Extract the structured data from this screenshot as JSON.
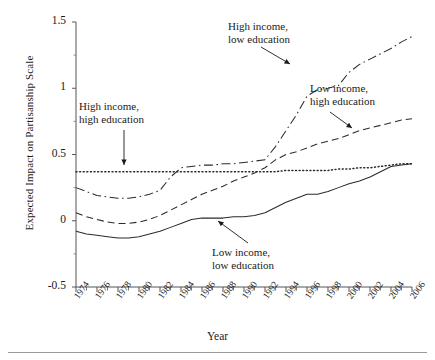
{
  "figure": {
    "xlabel": "Year",
    "ylabel": "Expected Impact on Partisanship Scale",
    "yticks": [
      "1.5",
      "1",
      "0.5",
      "0",
      "-0.5"
    ],
    "xticks": [
      "1974",
      "1976",
      "1978",
      "1980",
      "1982",
      "1984",
      "1986",
      "1988",
      "1990",
      "1992",
      "1994",
      "1996",
      "1998",
      "2000",
      "2002",
      "2004",
      "2006"
    ]
  },
  "annotations": {
    "hi_hi": {
      "line1": "High income,",
      "line2": "high education"
    },
    "hi_lo": {
      "line1": "High income,",
      "line2": "low education"
    },
    "lo_hi": {
      "line1": "Low income,",
      "line2": "high education"
    },
    "lo_lo": {
      "line1": "Low income,",
      "line2": "low education"
    }
  },
  "chart_data": {
    "type": "line",
    "title": "",
    "xlabel": "Year",
    "ylabel": "Expected Impact on Partisanship Scale",
    "xlim": [
      1974,
      2006
    ],
    "ylim": [
      -0.5,
      1.5
    ],
    "ytick_values": [
      1.5,
      1,
      0.5,
      0,
      -0.5
    ],
    "grid": false,
    "legend": "annotations-with-arrows",
    "x": [
      1974,
      1975,
      1976,
      1977,
      1978,
      1979,
      1980,
      1981,
      1982,
      1983,
      1984,
      1985,
      1986,
      1987,
      1988,
      1989,
      1990,
      1991,
      1992,
      1993,
      1994,
      1995,
      1996,
      1997,
      1998,
      1999,
      2000,
      2001,
      2002,
      2003,
      2004,
      2005,
      2006
    ],
    "series": [
      {
        "name": "High income, high education",
        "style": "dotted",
        "values": [
          0.37,
          0.37,
          0.37,
          0.37,
          0.37,
          0.37,
          0.37,
          0.37,
          0.37,
          0.37,
          0.37,
          0.37,
          0.37,
          0.37,
          0.37,
          0.37,
          0.37,
          0.37,
          0.37,
          0.37,
          0.38,
          0.38,
          0.38,
          0.38,
          0.38,
          0.39,
          0.39,
          0.4,
          0.4,
          0.41,
          0.42,
          0.43,
          0.43
        ]
      },
      {
        "name": "High income, low education",
        "style": "dash-dot",
        "values": [
          0.25,
          0.22,
          0.19,
          0.18,
          0.17,
          0.17,
          0.18,
          0.2,
          0.23,
          0.33,
          0.4,
          0.41,
          0.42,
          0.42,
          0.43,
          0.43,
          0.44,
          0.45,
          0.46,
          0.56,
          0.68,
          0.8,
          0.94,
          0.99,
          1.0,
          1.02,
          1.12,
          1.18,
          1.22,
          1.26,
          1.3,
          1.35,
          1.39
        ]
      },
      {
        "name": "Low income, high education",
        "style": "dashed",
        "values": [
          0.06,
          0.03,
          0.01,
          -0.01,
          -0.02,
          -0.02,
          -0.01,
          0.01,
          0.04,
          0.08,
          0.12,
          0.16,
          0.2,
          0.23,
          0.26,
          0.3,
          0.33,
          0.36,
          0.4,
          0.46,
          0.5,
          0.52,
          0.55,
          0.58,
          0.6,
          0.62,
          0.65,
          0.68,
          0.7,
          0.72,
          0.74,
          0.76,
          0.77
        ]
      },
      {
        "name": "Low income, low education",
        "style": "solid",
        "values": [
          -0.08,
          -0.1,
          -0.11,
          -0.12,
          -0.13,
          -0.13,
          -0.12,
          -0.1,
          -0.08,
          -0.05,
          -0.02,
          0.01,
          0.02,
          0.02,
          0.02,
          0.03,
          0.03,
          0.04,
          0.06,
          0.1,
          0.14,
          0.17,
          0.2,
          0.2,
          0.22,
          0.25,
          0.28,
          0.3,
          0.33,
          0.37,
          0.41,
          0.42,
          0.43
        ]
      }
    ]
  }
}
